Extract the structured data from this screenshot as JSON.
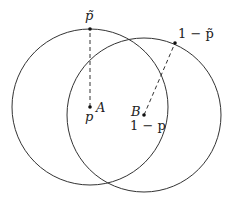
{
  "diagram": {
    "type": "two overlapping circles",
    "circles": [
      {
        "name": "A",
        "cx": 90,
        "cy": 107,
        "r": 78
      },
      {
        "name": "B",
        "cx": 144,
        "cy": 115,
        "r": 77
      }
    ],
    "points": {
      "A_center": {
        "label": "A",
        "sublabel": "p",
        "x": 90,
        "y": 107
      },
      "B_center": {
        "label": "B",
        "sublabel": "1 − p",
        "x": 144,
        "y": 115
      },
      "A_top": {
        "label": "p̃",
        "x": 90,
        "y": 29
      },
      "B_edge": {
        "label": "1 − p̃",
        "x": 175,
        "y": 43
      }
    },
    "colors": {
      "stroke": "#333333",
      "background": "#ffffff"
    }
  },
  "labels": {
    "A": "A",
    "p": "p",
    "B": "B",
    "one_minus_p": "1 − p",
    "p_tilde": "p̃",
    "one_minus_p_tilde": "1 − p̃"
  }
}
